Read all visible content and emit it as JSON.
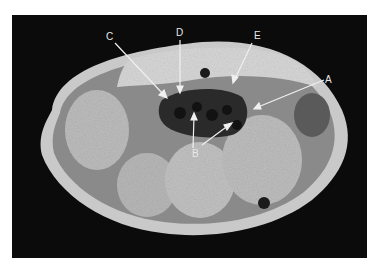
{
  "figure": {
    "labels": [
      {
        "id": "A",
        "text": "A"
      },
      {
        "id": "B",
        "text": "B"
      },
      {
        "id": "C",
        "text": "C"
      },
      {
        "id": "D",
        "text": "D"
      },
      {
        "id": "E",
        "text": "E"
      }
    ],
    "colors": {
      "background": "#0b0b0b",
      "arrow": "#f0f0f0",
      "page": "#ffffff"
    }
  }
}
